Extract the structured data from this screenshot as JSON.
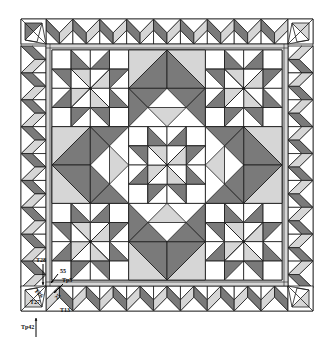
{
  "diagram": {
    "type": "quilt-pattern",
    "colors": {
      "dark": "#7a7a7a",
      "light": "#d6d6d6",
      "white": "#ffffff",
      "line": "#1a1a1a"
    },
    "quilt": {
      "outer": {
        "x": 21,
        "y": 19,
        "size": 292
      },
      "border_width": 25,
      "inner_strip": 6,
      "field": {
        "x": 52,
        "y": 50,
        "size": 230
      },
      "grid_units": 6
    },
    "labels": [
      {
        "id": "T28",
        "text": "T28",
        "x": 36,
        "y": 262
      },
      {
        "id": "55",
        "text": "55",
        "x": 60,
        "y": 273
      },
      {
        "id": "Tp5",
        "text": "Tp5",
        "x": 62,
        "y": 282
      },
      {
        "id": "T26",
        "text": "T26",
        "x": 34,
        "y": 291,
        "rotate": 45
      },
      {
        "id": "T27",
        "text": "T27",
        "x": 30,
        "y": 304
      },
      {
        "id": "25",
        "text": "25",
        "x": 57,
        "y": 300,
        "rotate": -45
      },
      {
        "id": "T13",
        "text": "T13",
        "x": 60,
        "y": 312
      },
      {
        "id": "Tp42",
        "text": "Tp42",
        "x": 21,
        "y": 329
      }
    ]
  }
}
